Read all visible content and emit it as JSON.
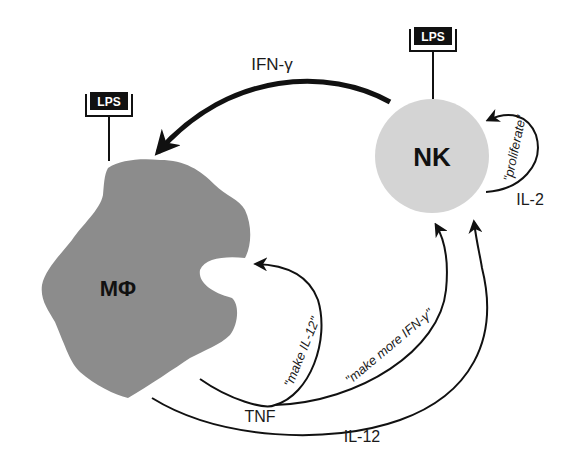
{
  "diagram": {
    "type": "cell-signaling-loop",
    "colors": {
      "macrophage_fill": "#8c8c8c",
      "nk_fill": "#d4d4d4",
      "arrow": "#111111",
      "background": "#ffffff"
    },
    "nodes": {
      "macrophage": {
        "label": "MΦ"
      },
      "nk": {
        "label": "NK"
      }
    },
    "receptors": {
      "macrophage_lps": {
        "label": "LPS"
      },
      "nk_lps": {
        "label": "LPS"
      }
    },
    "edges": {
      "ifn_gamma": {
        "label": "IFN-γ",
        "from": "NK",
        "to": "MΦ"
      },
      "il2": {
        "label": "IL-2",
        "from": "NK",
        "to": "NK",
        "annotation": "\"proliferate\""
      },
      "tnf": {
        "label": "TNF",
        "from": "MΦ",
        "to": [
          "MΦ",
          "NK"
        ]
      },
      "tnf_to_mac_annotation": "\"make IL-12\"",
      "tnf_to_nk_annotation": "\"make more IFN-γ\"",
      "il12": {
        "label": "IL-12",
        "from": "MΦ",
        "to": "NK"
      }
    }
  }
}
